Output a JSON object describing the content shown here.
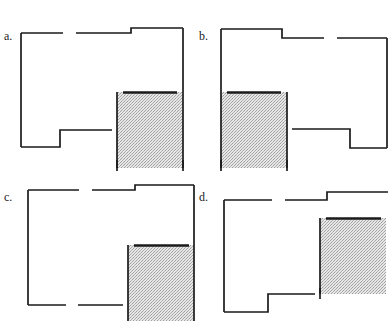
{
  "figure": {
    "type": "floor-plan-variants",
    "width": 388,
    "height": 321,
    "background_color": "#ffffff",
    "wall_color": "#1a1a1a",
    "shade_fill_color": "#d9d9d9",
    "shade_pattern": "stipple-dots",
    "label_color": "#1a1a1a"
  },
  "panels": [
    {
      "id": "a",
      "label": "a.",
      "label_x": 4,
      "label_y": 30,
      "shaded_room": {
        "x": 117,
        "y": 92,
        "width": 66,
        "height": 76
      },
      "notes": "Shaded room at lower-right; bottom-left notch in footprint; top wall steps up near right."
    },
    {
      "id": "b",
      "label": "b.",
      "label_x": 199,
      "label_y": 30,
      "shaded_room": {
        "x": 221,
        "y": 92,
        "width": 66,
        "height": 76
      },
      "notes": "Mirror image of a; shaded room at lower-left; bottom-right notch in footprint."
    },
    {
      "id": "c",
      "label": "c.",
      "label_x": 4,
      "label_y": 191,
      "shaded_room": {
        "x": 128,
        "y": 245,
        "width": 66,
        "height": 76
      },
      "notes": "Shaded room at lower-right; straight bottom wall (no notch); top wall steps up near right."
    },
    {
      "id": "d",
      "label": "d.",
      "label_x": 199,
      "label_y": 191,
      "shaded_room": {
        "x": 320,
        "y": 218,
        "width": 66,
        "height": 76
      },
      "notes": "Shaded room at right, cropped by image edge; bottom-left notch in footprint."
    }
  ],
  "geometry": {
    "panel_a": {
      "wall_segments": [
        [
          21,
          33,
          63,
          33
        ],
        [
          76,
          33,
          131,
          33
        ],
        [
          131,
          33,
          131,
          28
        ],
        [
          131,
          28,
          183,
          28
        ],
        [
          183,
          28,
          183,
          92
        ],
        [
          183,
          92,
          183,
          97
        ],
        [
          121,
          92,
          176,
          92
        ],
        [
          183,
          92,
          183,
          168
        ],
        [
          117,
          92,
          117,
          168
        ],
        [
          117,
          130,
          60,
          130
        ],
        [
          60,
          130,
          60,
          147
        ],
        [
          60,
          147,
          21,
          147
        ],
        [
          21,
          147,
          21,
          33
        ],
        [
          117,
          162,
          117,
          171
        ],
        [
          183,
          162,
          183,
          171
        ]
      ]
    },
    "panel_b": {
      "wall_segments": [
        [
          221,
          29,
          282,
          29
        ],
        [
          282,
          29,
          282,
          38
        ],
        [
          282,
          38,
          324,
          38
        ],
        [
          337,
          38,
          387,
          38
        ],
        [
          387,
          38,
          387,
          148
        ],
        [
          387,
          148,
          350,
          148
        ],
        [
          350,
          148,
          350,
          129
        ],
        [
          350,
          129,
          287,
          129
        ],
        [
          287,
          92,
          287,
          168
        ],
        [
          221,
          92,
          221,
          168
        ],
        [
          227,
          92,
          281,
          92
        ],
        [
          221,
          92,
          221,
          29
        ],
        [
          221,
          162,
          221,
          171
        ],
        [
          287,
          162,
          287,
          171
        ]
      ]
    },
    "panel_c": {
      "wall_segments": [
        [
          28,
          190,
          79,
          190
        ],
        [
          92,
          190,
          135,
          190
        ],
        [
          135,
          190,
          135,
          185
        ],
        [
          135,
          185,
          194,
          185
        ],
        [
          194,
          185,
          194,
          245
        ],
        [
          139,
          245,
          190,
          245
        ],
        [
          194,
          245,
          194,
          321
        ],
        [
          128,
          245,
          128,
          321
        ],
        [
          128,
          305,
          78,
          305
        ],
        [
          66,
          305,
          28,
          305
        ],
        [
          28,
          305,
          28,
          190
        ]
      ]
    },
    "panel_d": {
      "wall_segments": [
        [
          224,
          200,
          272,
          200
        ],
        [
          285,
          200,
          327,
          200
        ],
        [
          327,
          200,
          327,
          192
        ],
        [
          327,
          192,
          388,
          192
        ],
        [
          331,
          218,
          385,
          218
        ],
        [
          320,
          218,
          320,
          294
        ],
        [
          320,
          294,
          268,
          294
        ],
        [
          256,
          294,
          224,
          294
        ],
        [
          224,
          294,
          224,
          312
        ],
        [
          224,
          312,
          224,
          200
        ],
        [
          320,
          288,
          320,
          298
        ]
      ]
    }
  }
}
